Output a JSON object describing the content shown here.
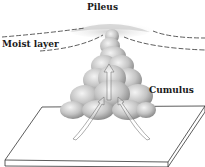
{
  "diagram": {
    "labels": {
      "pileus": "Pileus",
      "moist_layer": "Moist layer",
      "cumulus": "Cumulus"
    },
    "colors": {
      "line": "#333333",
      "cloud_light": "#e6e6e6",
      "cloud_mid": "#bdbdbd",
      "cloud_dark": "#8c8c8c",
      "background": "#ffffff"
    },
    "elements": [
      "pileus cap cloud",
      "moist layer dashed lines",
      "cumulus cloud tower",
      "updraft arrows",
      "ground slab"
    ]
  }
}
